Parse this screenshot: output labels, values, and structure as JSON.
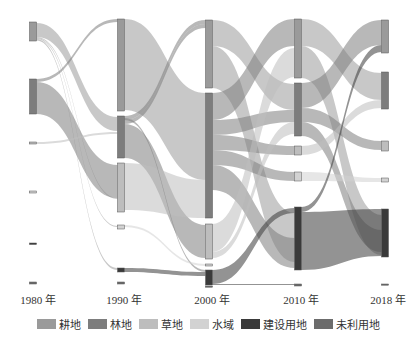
{
  "chart_data": {
    "type": "sankey",
    "title": "",
    "columns": [
      "1980 年",
      "1990 年",
      "2000 年",
      "2010 年",
      "2018 年"
    ],
    "column_x": [
      33,
      121,
      209,
      298,
      385
    ],
    "node_width": 7,
    "categories": [
      "耕地",
      "林地",
      "草地",
      "水域",
      "建设用地",
      "未利用地"
    ],
    "colors": {
      "耕地": "#9a9a9a",
      "林地": "#7d7d7d",
      "草地": "#bdbdbd",
      "水域": "#d2d2d2",
      "建设用地": "#3a3a3a",
      "未利用地": "#6c6c6c"
    },
    "nodes": [
      {
        "col": 0,
        "cat": "耕地",
        "y0": 22,
        "y1": 41
      },
      {
        "col": 0,
        "cat": "林地",
        "y0": 79,
        "y1": 114
      },
      {
        "col": 0,
        "cat": "草地",
        "y0": 142,
        "y1": 144
      },
      {
        "col": 0,
        "cat": "水域",
        "y0": 191,
        "y1": 193
      },
      {
        "col": 0,
        "cat": "建设用地",
        "y0": 243,
        "y1": 244.5
      },
      {
        "col": 0,
        "cat": "未利用地",
        "y0": 282,
        "y1": 284
      },
      {
        "col": 1,
        "cat": "耕地",
        "y0": 19,
        "y1": 111
      },
      {
        "col": 1,
        "cat": "林地",
        "y0": 116,
        "y1": 158
      },
      {
        "col": 1,
        "cat": "草地",
        "y0": 163,
        "y1": 212
      },
      {
        "col": 1,
        "cat": "水域",
        "y0": 225,
        "y1": 229
      },
      {
        "col": 1,
        "cat": "建设用地",
        "y0": 268,
        "y1": 272
      },
      {
        "col": 1,
        "cat": "未利用地",
        "y0": 282,
        "y1": 284
      },
      {
        "col": 2,
        "cat": "耕地",
        "y0": 20,
        "y1": 88
      },
      {
        "col": 2,
        "cat": "林地",
        "y0": 93,
        "y1": 218
      },
      {
        "col": 2,
        "cat": "草地",
        "y0": 224,
        "y1": 259
      },
      {
        "col": 2,
        "cat": "水域",
        "y0": 264,
        "y1": 266
      },
      {
        "col": 2,
        "cat": "建设用地",
        "y0": 270,
        "y1": 285
      },
      {
        "col": 2,
        "cat": "未利用地",
        "y0": 286,
        "y1": 287
      },
      {
        "col": 3,
        "cat": "耕地",
        "y0": 19,
        "y1": 78
      },
      {
        "col": 3,
        "cat": "林地",
        "y0": 83,
        "y1": 136
      },
      {
        "col": 3,
        "cat": "草地",
        "y0": 146,
        "y1": 155
      },
      {
        "col": 3,
        "cat": "水域",
        "y0": 172,
        "y1": 181
      },
      {
        "col": 3,
        "cat": "建设用地",
        "y0": 207,
        "y1": 270
      },
      {
        "col": 3,
        "cat": "未利用地",
        "y0": 284,
        "y1": 286
      },
      {
        "col": 4,
        "cat": "耕地",
        "y0": 20,
        "y1": 53
      },
      {
        "col": 4,
        "cat": "林地",
        "y0": 72,
        "y1": 109
      },
      {
        "col": 4,
        "cat": "草地",
        "y0": 141,
        "y1": 151
      },
      {
        "col": 4,
        "cat": "水域",
        "y0": 178,
        "y1": 182
      },
      {
        "col": 4,
        "cat": "建设用地",
        "y0": 209,
        "y1": 257
      },
      {
        "col": 4,
        "cat": "未利用地",
        "y0": 284,
        "y1": 285
      }
    ],
    "links": [
      {
        "from": 0,
        "sy0": 23,
        "sy1": 37,
        "ty0": 117,
        "ty1": 131,
        "cat": "耕地"
      },
      {
        "from": 0,
        "sy0": 37,
        "sy1": 38,
        "ty0": 198,
        "ty1": 199,
        "cat": "耕地"
      },
      {
        "from": 0,
        "sy0": 38,
        "sy1": 39,
        "ty0": 226,
        "ty1": 227,
        "cat": "耕地"
      },
      {
        "from": 0,
        "sy0": 39,
        "sy1": 40.5,
        "ty0": 268,
        "ty1": 270,
        "cat": "耕地"
      },
      {
        "from": 0,
        "sy0": 79,
        "sy1": 82,
        "ty0": 19,
        "ty1": 22,
        "cat": "林地"
      },
      {
        "from": 0,
        "sy0": 82,
        "sy1": 114,
        "ty0": 165,
        "ty1": 198,
        "cat": "林地"
      },
      {
        "from": 0,
        "sy0": 142,
        "sy1": 144,
        "ty0": 132,
        "ty1": 134,
        "cat": "草地"
      },
      {
        "from": 1,
        "sy0": 19,
        "sy1": 110,
        "ty0": 93,
        "ty1": 180,
        "cat": "耕地"
      },
      {
        "from": 1,
        "sy0": 116,
        "sy1": 120,
        "ty0": 20,
        "ty1": 24,
        "cat": "林地"
      },
      {
        "from": 1,
        "sy0": 120,
        "sy1": 124,
        "ty0": 24,
        "ty1": 28,
        "cat": "林地"
      },
      {
        "from": 1,
        "sy0": 124,
        "sy1": 158,
        "ty0": 225,
        "ty1": 258,
        "cat": "林地"
      },
      {
        "from": 1,
        "sy0": 163,
        "sy1": 210,
        "ty0": 180,
        "ty1": 218,
        "cat": "草地"
      },
      {
        "from": 1,
        "sy0": 118,
        "sy1": 120,
        "ty0": 270,
        "ty1": 272,
        "cat": "林地"
      },
      {
        "from": 1,
        "sy0": 268,
        "sy1": 272,
        "ty0": 272,
        "ty1": 276,
        "cat": "建设用地"
      },
      {
        "from": 1,
        "sy0": 225,
        "sy1": 227,
        "ty0": 264,
        "ty1": 266,
        "cat": "水域"
      },
      {
        "from": 2,
        "sy0": 20,
        "sy1": 46,
        "ty0": 84,
        "ty1": 110,
        "cat": "耕地"
      },
      {
        "from": 2,
        "sy0": 46,
        "sy1": 88,
        "ty0": 213,
        "ty1": 262,
        "cat": "耕地"
      },
      {
        "from": 2,
        "sy0": 93,
        "sy1": 120,
        "ty0": 19,
        "ty1": 46,
        "cat": "林地"
      },
      {
        "from": 2,
        "sy0": 120,
        "sy1": 135,
        "ty0": 110,
        "ty1": 122,
        "cat": "林地"
      },
      {
        "from": 2,
        "sy0": 135,
        "sy1": 150,
        "ty0": 146,
        "ty1": 155,
        "cat": "林地"
      },
      {
        "from": 2,
        "sy0": 150,
        "sy1": 165,
        "ty0": 172,
        "ty1": 181,
        "cat": "林地"
      },
      {
        "from": 2,
        "sy0": 165,
        "sy1": 190,
        "ty0": 238,
        "ty1": 268,
        "cat": "林地"
      },
      {
        "from": 2,
        "sy0": 224,
        "sy1": 252,
        "ty0": 48,
        "ty1": 77,
        "cat": "草地"
      },
      {
        "from": 2,
        "sy0": 252,
        "sy1": 258,
        "ty0": 122,
        "ty1": 134,
        "cat": "草地"
      },
      {
        "from": 2,
        "sy0": 270,
        "sy1": 284,
        "ty0": 208,
        "ty1": 213,
        "cat": "建设用地"
      },
      {
        "from": 2,
        "sy0": 284,
        "sy1": 285,
        "ty0": 284,
        "ty1": 285,
        "cat": "建设用地"
      },
      {
        "from": 3,
        "sy0": 19,
        "sy1": 46,
        "ty0": 73,
        "ty1": 100,
        "cat": "耕地"
      },
      {
        "from": 3,
        "sy0": 46,
        "sy1": 78,
        "ty0": 215,
        "ty1": 255,
        "cat": "耕地"
      },
      {
        "from": 3,
        "sy0": 83,
        "sy1": 108,
        "ty0": 20,
        "ty1": 45,
        "cat": "林地"
      },
      {
        "from": 3,
        "sy0": 108,
        "sy1": 122,
        "ty0": 141,
        "ty1": 150,
        "cat": "林地"
      },
      {
        "from": 3,
        "sy0": 122,
        "sy1": 136,
        "ty0": 230,
        "ty1": 252,
        "cat": "林地"
      },
      {
        "from": 3,
        "sy0": 146,
        "sy1": 155,
        "ty0": 100,
        "ty1": 108,
        "cat": "草地"
      },
      {
        "from": 3,
        "sy0": 172,
        "sy1": 181,
        "ty0": 178,
        "ty1": 182,
        "cat": "水域"
      },
      {
        "from": 3,
        "sy0": 207,
        "sy1": 212,
        "ty0": 45,
        "ty1": 52,
        "cat": "建设用地"
      },
      {
        "from": 3,
        "sy0": 212,
        "sy1": 270,
        "ty0": 209,
        "ty1": 256,
        "cat": "建设用地"
      }
    ]
  },
  "legend": {
    "items": [
      {
        "label": "耕地",
        "color": "#9a9a9a"
      },
      {
        "label": "林地",
        "color": "#7d7d7d"
      },
      {
        "label": "草地",
        "color": "#bdbdbd"
      },
      {
        "label": "水域",
        "color": "#d2d2d2"
      },
      {
        "label": "建设用地",
        "color": "#3a3a3a"
      },
      {
        "label": "未利用地",
        "color": "#6c6c6c"
      }
    ]
  },
  "axis": {
    "years": [
      "1980 年",
      "1990 年",
      "2000 年",
      "2010 年",
      "2018 年"
    ]
  }
}
